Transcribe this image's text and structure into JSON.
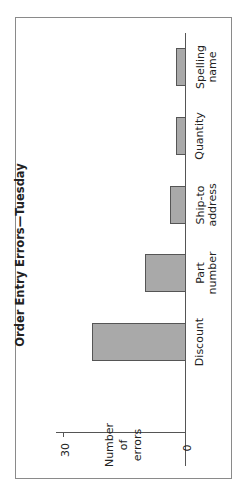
{
  "chart_data": {
    "type": "bar",
    "orientation": "vertical bars, figure rotated 90° counter-clockwise",
    "title": "Order Entry Errors—Tuesday",
    "xlabel": "",
    "ylabel": "Number of errors",
    "ylabel_lines": [
      "Number",
      "of",
      "errors"
    ],
    "categories": [
      "Discount",
      "Part number",
      "Ship-to address",
      "Quantity",
      "Spelling name"
    ],
    "category_lines": [
      [
        "Discount"
      ],
      [
        "Part",
        "number"
      ],
      [
        "Ship-to",
        "address"
      ],
      [
        "Quantity"
      ],
      [
        "Spelling",
        "name"
      ]
    ],
    "values": [
      23,
      10,
      4,
      2.5,
      2.5
    ],
    "yticks": [
      "0",
      "30"
    ],
    "ylim": [
      0,
      30
    ],
    "grid": false,
    "legend": null,
    "bar_color": "#a9a9a9"
  }
}
